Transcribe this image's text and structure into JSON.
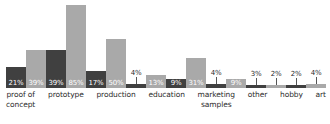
{
  "chart_data": {
    "type": "bar",
    "title": "",
    "subtitle": "",
    "xlabel": "",
    "ylabel": "",
    "ylim": [
      0,
      90
    ],
    "grid": false,
    "legend_position": "none",
    "value_suffix": "%",
    "categories": [
      "proof of\nconcept",
      "prototype",
      "production",
      "education",
      "marketing\nsamples",
      "other",
      "hobby",
      "art"
    ],
    "series": [
      {
        "name": "series-1",
        "color": "#404040",
        "values": [
          21,
          39,
          17,
          4,
          9,
          4,
          3,
          2
        ],
        "labels": [
          "21%",
          "39%",
          "17%",
          "4%",
          "9%",
          "4%",
          "3%",
          "2%"
        ]
      },
      {
        "name": "series-2",
        "color": "#a9a9a9",
        "values": [
          39,
          85,
          50,
          13,
          31,
          9,
          2,
          4
        ],
        "labels": [
          "39%",
          "85%",
          "50%",
          "13%",
          "31%",
          "9%",
          "2%",
          "4%"
        ]
      }
    ]
  },
  "colors": {
    "background": "#ffffff",
    "series_dark": "#404040",
    "series_light": "#a9a9a9",
    "label_text": "#2b2b2b",
    "value_text_inside": "#ffffff",
    "leader_line": "#555555"
  }
}
